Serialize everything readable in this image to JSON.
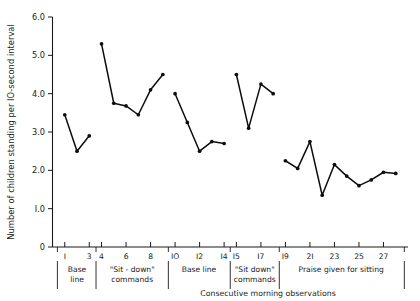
{
  "chart_data": {
    "type": "line",
    "title": "",
    "xlabel": "Consecutive morning observations",
    "ylabel": "Number of children standing per IO-second interval",
    "ylim": [
      0,
      6.0
    ],
    "xlim": [
      0,
      29
    ],
    "grid": false,
    "legend": "none",
    "ytick_labels": [
      "0",
      "I.0",
      "2.0",
      "3.0",
      "4.0",
      "5.0",
      "6.0"
    ],
    "ytick_values": [
      0,
      1.0,
      2.0,
      3.0,
      4.0,
      5.0,
      6.0
    ],
    "xtick_labels": [
      "I",
      "3",
      "4",
      "6",
      "8",
      "IO",
      "I2",
      "I4",
      "I5",
      "I7",
      "I9",
      "2I",
      "23",
      "25",
      "27"
    ],
    "xtick_values": [
      1,
      3,
      4,
      6,
      8,
      10,
      12,
      14,
      15,
      17,
      19,
      21,
      23,
      25,
      27
    ],
    "phases": [
      {
        "label_line1": "Base",
        "label_line2": "line",
        "x_start": 0.4,
        "x_end": 3.6
      },
      {
        "label_line1": "\"Sit - down\"",
        "label_line2": "commands",
        "x_start": 3.6,
        "x_end": 9.4
      },
      {
        "label_line1": "Base  line",
        "label_line2": "",
        "x_start": 9.4,
        "x_end": 14.5
      },
      {
        "label_line1": "\"Sit down\"",
        "label_line2": "commands",
        "x_start": 14.5,
        "x_end": 18.5
      },
      {
        "label_line1": "Praise given for sitting",
        "label_line2": "",
        "x_start": 18.5,
        "x_end": 28.6
      }
    ],
    "series": [
      {
        "name": "Base line 1",
        "x": [
          1,
          2,
          3
        ],
        "values": [
          3.45,
          2.5,
          2.9
        ]
      },
      {
        "name": "Sit-down commands 1",
        "x": [
          4,
          5,
          6,
          7,
          8,
          9
        ],
        "values": [
          5.3,
          3.75,
          3.68,
          3.45,
          4.1,
          4.5
        ]
      },
      {
        "name": "Base line 2",
        "x": [
          10,
          11,
          12,
          13,
          14
        ],
        "values": [
          4.0,
          3.25,
          2.5,
          2.75,
          2.7
        ]
      },
      {
        "name": "Sit-down commands 2",
        "x": [
          15,
          16,
          17,
          18
        ],
        "values": [
          4.5,
          3.1,
          4.25,
          4.0
        ]
      },
      {
        "name": "Praise given for sitting",
        "x": [
          19,
          20,
          21,
          22,
          23,
          24,
          25,
          26,
          27,
          28
        ],
        "values": [
          2.25,
          2.05,
          2.75,
          1.35,
          2.15,
          1.85,
          1.6,
          1.75,
          1.95,
          1.92
        ]
      }
    ]
  }
}
